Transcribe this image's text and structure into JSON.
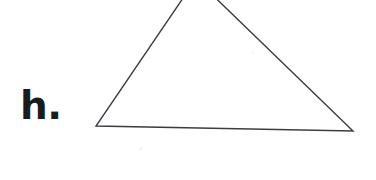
{
  "page": {
    "width": 376,
    "height": 180,
    "background_color": "#ffffff",
    "kind": "worksheet-geometry-figure"
  },
  "label": {
    "text": "h.",
    "color": "#1b1b1b",
    "x": 20,
    "y": 86
  },
  "figure": {
    "name": "triangle",
    "stroke_color": "#3b3b42",
    "stroke_width": 1.4,
    "fill": "none",
    "vertices": [
      {
        "name": "apex",
        "x": 196,
        "y": -21,
        "cropped": true
      },
      {
        "name": "bottom-right",
        "x": 353,
        "y": 131
      },
      {
        "name": "bottom-left",
        "x": 96,
        "y": 126
      }
    ],
    "edges": [
      {
        "name": "left-edge",
        "from": "bottom-left",
        "to": "apex"
      },
      {
        "name": "right-edge",
        "from": "apex",
        "to": "bottom-right"
      },
      {
        "name": "base-edge",
        "from": "bottom-left",
        "to": "bottom-right"
      }
    ],
    "polygon_points": "196,-21 353,131 96,126"
  },
  "artifacts": [
    {
      "name": "scan-speck-1",
      "x": 139,
      "y": 147,
      "size": 3,
      "color": "#f3f1f2"
    },
    {
      "name": "scan-speck-2",
      "x": 252,
      "y": 52,
      "size": 2,
      "color": "#f4f2f3"
    }
  ]
}
